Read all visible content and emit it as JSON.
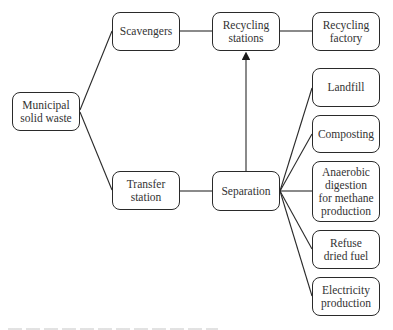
{
  "diagram": {
    "type": "flowchart",
    "nodes": {
      "msw": "Municipal\nsolid waste",
      "scavengers": "Scavengers",
      "recycling_stations": "Recycling\nstations",
      "recycling_factory": "Recycling\nfactory",
      "transfer_station": "Transfer\nstation",
      "separation": "Separation",
      "landfill": "Landfill",
      "composting": "Composting",
      "anaerobic": "Anaerobic\ndigestion\nfor methane\nproduction",
      "rdf": "Refuse\ndried fuel",
      "electricity": "Electricity\nproduction"
    },
    "edges": [
      [
        "Municipal solid waste",
        "Scavengers"
      ],
      [
        "Municipal solid waste",
        "Transfer station"
      ],
      [
        "Scavengers",
        "Recycling stations"
      ],
      [
        "Recycling stations",
        "Recycling factory"
      ],
      [
        "Transfer station",
        "Separation"
      ],
      [
        "Separation",
        "Recycling stations",
        "arrow"
      ],
      [
        "Separation",
        "Landfill"
      ],
      [
        "Separation",
        "Composting"
      ],
      [
        "Separation",
        "Anaerobic digestion for methane production"
      ],
      [
        "Separation",
        "Refuse dried fuel"
      ],
      [
        "Separation",
        "Electricity production"
      ]
    ],
    "colors": {
      "line": "#2a2a2a",
      "text": "#333333",
      "background": "#ffffff"
    }
  }
}
